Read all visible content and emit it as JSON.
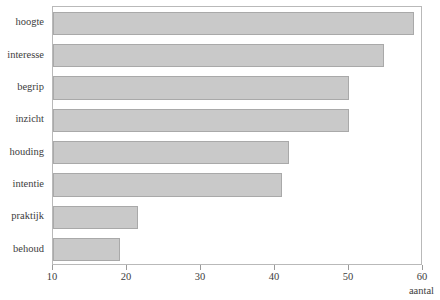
{
  "chart_data": {
    "type": "bar",
    "orientation": "horizontal",
    "title": "",
    "xlabel": "aantal",
    "ylabel": "",
    "categories": [
      "hoogte",
      "interesse",
      "begrip",
      "inzicht",
      "houding",
      "intentie",
      "praktijk",
      "behoud"
    ],
    "values": [
      58.8,
      54.7,
      50.0,
      50.0,
      41.9,
      41.0,
      21.5,
      19.0
    ],
    "xlim": [
      10,
      60
    ],
    "xticks": [
      10,
      20,
      30,
      40,
      50,
      60
    ],
    "xtick_labels": [
      "10",
      "20",
      "30",
      "40",
      "50",
      "60"
    ],
    "grid": false,
    "legend": false,
    "bar_color": "#c9c9c9",
    "bar_border_color": "#a9a9a9",
    "frame_color": "#b9b9b9",
    "background": "#ffffff"
  }
}
